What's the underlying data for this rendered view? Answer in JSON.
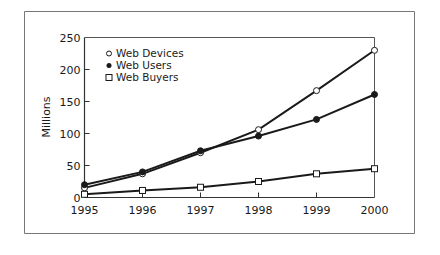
{
  "chart_data": {
    "type": "line",
    "title": "",
    "xlabel": "",
    "ylabel": "Millions",
    "x": [
      1995,
      1996,
      1997,
      1998,
      1999,
      2000
    ],
    "x_tick_labels": [
      "1995",
      "1996",
      "1997",
      "1998",
      "1999",
      "2000"
    ],
    "y_ticks": [
      0,
      50,
      100,
      150,
      200,
      250
    ],
    "y_tick_labels": [
      "0",
      "50",
      "100",
      "150",
      "200",
      "250"
    ],
    "ylim": [
      0,
      250
    ],
    "xlim": [
      1995,
      2000
    ],
    "grid": false,
    "legend_position": "upper-left",
    "series": [
      {
        "name": "Web Devices",
        "marker": "open-circle",
        "values": [
          15,
          37,
          70,
          106,
          167,
          230
        ]
      },
      {
        "name": "Web Users",
        "marker": "filled-circle",
        "values": [
          20,
          40,
          73,
          96,
          122,
          161
        ]
      },
      {
        "name": "Web Buyers",
        "marker": "open-square",
        "values": [
          5,
          11,
          16,
          25,
          37,
          45
        ]
      }
    ]
  },
  "legend": {
    "items": [
      {
        "label": "Web Devices",
        "marker": "open-circle"
      },
      {
        "label": "Web Users",
        "marker": "filled-circle"
      },
      {
        "label": "Web Buyers",
        "marker": "open-square"
      }
    ]
  },
  "colors": {
    "line": "#1a1a1a",
    "frame": "#777777",
    "background": "#ffffff"
  }
}
